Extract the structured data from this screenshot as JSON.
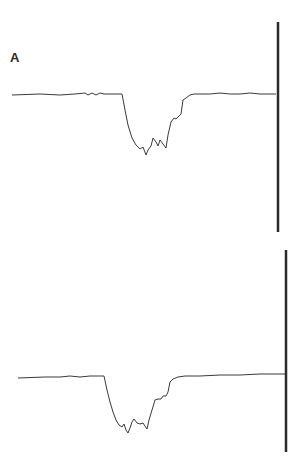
{
  "figure": {
    "panel_label": "A",
    "traces": [
      {
        "name": "top-trace",
        "baseline_y": 94,
        "x_start": 12,
        "x_end": 276,
        "points": [
          [
            12,
            95
          ],
          [
            40,
            94
          ],
          [
            60,
            95
          ],
          [
            75,
            94
          ],
          [
            85,
            93
          ],
          [
            88,
            95
          ],
          [
            92,
            93
          ],
          [
            96,
            95
          ],
          [
            100,
            93
          ],
          [
            104,
            94
          ],
          [
            112,
            94
          ],
          [
            120,
            94
          ],
          [
            122,
            94
          ],
          [
            125,
            110
          ],
          [
            128,
            125
          ],
          [
            132,
            138
          ],
          [
            136,
            145
          ],
          [
            140,
            149
          ],
          [
            143,
            147
          ],
          [
            146,
            155
          ],
          [
            148,
            150
          ],
          [
            151,
            146
          ],
          [
            153,
            138
          ],
          [
            156,
            142
          ],
          [
            158,
            146
          ],
          [
            160,
            140
          ],
          [
            163,
            144
          ],
          [
            166,
            148
          ],
          [
            168,
            135
          ],
          [
            171,
            122
          ],
          [
            174,
            118
          ],
          [
            176,
            119
          ],
          [
            179,
            116
          ],
          [
            181,
            114
          ],
          [
            183,
            100
          ],
          [
            186,
            98
          ],
          [
            190,
            95
          ],
          [
            194,
            94
          ],
          [
            210,
            94
          ],
          [
            220,
            93
          ],
          [
            230,
            94
          ],
          [
            240,
            94
          ],
          [
            250,
            93
          ],
          [
            260,
            94
          ],
          [
            276,
            94
          ]
        ]
      },
      {
        "name": "bottom-trace",
        "baseline_y": 377,
        "x_start": 18,
        "x_end": 285,
        "points": [
          [
            18,
            378
          ],
          [
            45,
            377
          ],
          [
            60,
            377
          ],
          [
            70,
            376
          ],
          [
            80,
            377
          ],
          [
            90,
            376
          ],
          [
            100,
            376
          ],
          [
            104,
            376
          ],
          [
            107,
            390
          ],
          [
            110,
            402
          ],
          [
            113,
            412
          ],
          [
            116,
            420
          ],
          [
            119,
            425
          ],
          [
            122,
            427
          ],
          [
            124,
            424
          ],
          [
            126,
            430
          ],
          [
            128,
            433
          ],
          [
            130,
            428
          ],
          [
            132,
            422
          ],
          [
            134,
            419
          ],
          [
            137,
            423
          ],
          [
            140,
            424
          ],
          [
            143,
            423
          ],
          [
            145,
            426
          ],
          [
            147,
            429
          ],
          [
            149,
            420
          ],
          [
            152,
            410
          ],
          [
            155,
            400
          ],
          [
            158,
            399
          ],
          [
            161,
            399
          ],
          [
            163,
            396
          ],
          [
            166,
            396
          ],
          [
            168,
            392
          ],
          [
            170,
            382
          ],
          [
            173,
            379
          ],
          [
            178,
            377
          ],
          [
            185,
            376
          ],
          [
            200,
            376
          ],
          [
            220,
            375
          ],
          [
            240,
            375
          ],
          [
            260,
            374
          ],
          [
            285,
            374
          ]
        ]
      }
    ],
    "scale_bars": [
      {
        "name": "top-scale-bar",
        "x": 278,
        "y1": 22,
        "y2": 232
      },
      {
        "name": "bottom-scale-bar",
        "x": 286,
        "y1": 250,
        "y2": 452
      }
    ],
    "colors": {
      "trace": "#3a3a3a",
      "scale_bar": "#2a2a2a",
      "label": "#2a2a2a"
    }
  }
}
